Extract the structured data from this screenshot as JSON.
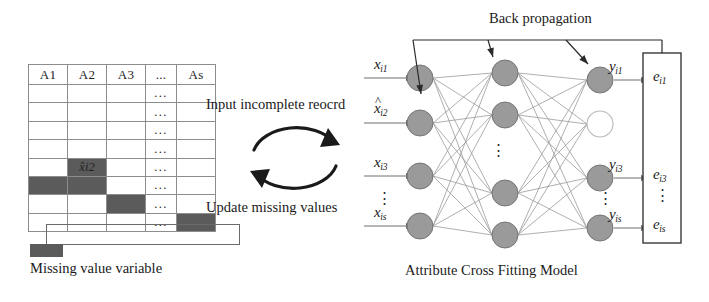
{
  "figure": {
    "title_caption_left": "Missing value variable",
    "title_caption_right": "Attribute Cross Fitting Model",
    "back_propagation_label": "Back propagation",
    "cycle": {
      "top_label": "Input incomplete reocrd",
      "bottom_label": "Update missing values",
      "top_arrow_icon": "curved-arrow-right-icon",
      "bottom_arrow_icon": "curved-arrow-left-icon"
    },
    "legend": {
      "swatch_color": "#5b5b5b",
      "label": "Missing value variable"
    }
  },
  "table": {
    "headers": [
      "A1",
      "A2",
      "A3",
      "...",
      "As"
    ],
    "ellipsis_cell": "...",
    "rows": [
      {
        "cells": [
          "",
          "",
          "",
          "...",
          ""
        ],
        "missing": []
      },
      {
        "cells": [
          "",
          "",
          "",
          "...",
          ""
        ],
        "missing": []
      },
      {
        "cells": [
          "",
          "",
          "",
          "...",
          ""
        ],
        "missing": []
      },
      {
        "cells": [
          "",
          "",
          "",
          "...",
          ""
        ],
        "missing": []
      },
      {
        "cells": [
          "",
          "x̂i2",
          "",
          "...",
          ""
        ],
        "missing": [
          1
        ]
      },
      {
        "cells": [
          "",
          "",
          "",
          "...",
          ""
        ],
        "missing": [
          0,
          1
        ]
      },
      {
        "cells": [
          "",
          "",
          "",
          "...",
          ""
        ],
        "missing": [
          2
        ]
      },
      {
        "cells": [
          "",
          "",
          "",
          "...",
          ""
        ],
        "missing": [
          4
        ]
      }
    ],
    "selected_row_index": 4,
    "missing_cell_color": "#5b5b5b",
    "grid_color": "#8d8d8d"
  },
  "network": {
    "node_fill": "#9a9a9a",
    "node_stroke": "#6e6e6e",
    "empty_node_stroke": "#b8b8b8",
    "layers": [
      {
        "name": "input-layer",
        "node_count": 4,
        "labels": [
          "x i1",
          "x̂ i2",
          "x i3",
          "x is"
        ]
      },
      {
        "name": "hidden-layer",
        "node_count": 4,
        "labels": []
      },
      {
        "name": "output-layer",
        "node_count": 4,
        "labels": [
          "y i1",
          "",
          "y i3",
          "y is"
        ]
      }
    ],
    "inputs": [
      {
        "base": "x",
        "sub": "i1",
        "hat": false
      },
      {
        "base": "x",
        "sub": "i2",
        "hat": true
      },
      {
        "base": "x",
        "sub": "i3",
        "hat": false
      },
      {
        "base": "x",
        "sub": "is",
        "hat": false
      }
    ],
    "input_vertical_dots": "⋮",
    "hidden_vertical_dots": "⋮",
    "output_vertical_dots": "⋮",
    "outputs": [
      {
        "base": "y",
        "sub": "i1"
      },
      {
        "base": "y",
        "sub": "i3"
      },
      {
        "base": "y",
        "sub": "is"
      }
    ],
    "errors": [
      {
        "base": "e",
        "sub": "i1"
      },
      {
        "base": "e",
        "sub": "i3"
      },
      {
        "base": "e",
        "sub": "is"
      }
    ],
    "error_vertical_dots": "⋮",
    "backprop_arrow_count": 3
  }
}
